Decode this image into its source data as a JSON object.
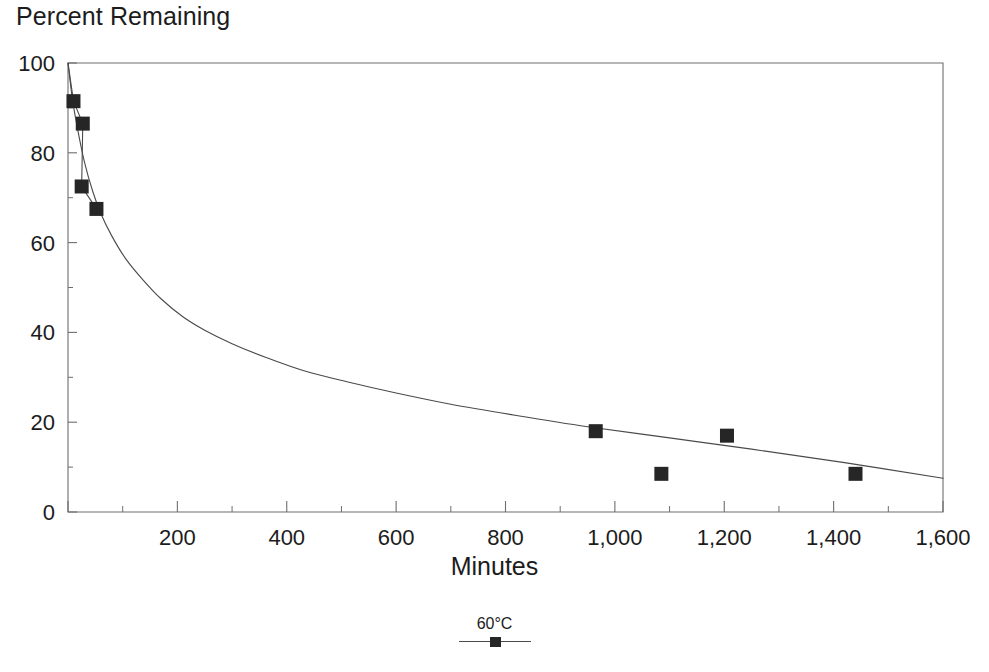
{
  "chart_data": {
    "type": "scatter",
    "title": "Percent Remaining",
    "xlabel": "Minutes",
    "ylabel": "Percent Remaining",
    "xlim": [
      0,
      1600
    ],
    "ylim": [
      0,
      100
    ],
    "grid": false,
    "legend_position": "bottom-center",
    "x_ticks": [
      0,
      200,
      400,
      600,
      800,
      1000,
      1200,
      1400,
      1600
    ],
    "x_tick_labels": [
      "",
      "200",
      "400",
      "600",
      "800",
      "1,000",
      "1,200",
      "1,400",
      "1,600"
    ],
    "x_minor_ticks": [
      100,
      300,
      500,
      700,
      900,
      1100,
      1300,
      1500
    ],
    "y_ticks": [
      0,
      20,
      40,
      60,
      80,
      100
    ],
    "y_tick_labels": [
      "0",
      "20",
      "40",
      "60",
      "80",
      "100"
    ],
    "y_minor_ticks": [
      10,
      30,
      50,
      70,
      90
    ],
    "series": [
      {
        "name": "60°C",
        "marker": "square",
        "marker_color": "#262626",
        "line_color": "#4a4a4a",
        "points": [
          {
            "x": 10,
            "y": 91.5
          },
          {
            "x": 27,
            "y": 86.5
          },
          {
            "x": 25,
            "y": 72.5
          },
          {
            "x": 52,
            "y": 67.5
          },
          {
            "x": 965,
            "y": 18.0
          },
          {
            "x": 1085,
            "y": 8.5
          },
          {
            "x": 1205,
            "y": 17.0
          },
          {
            "x": 1440,
            "y": 8.5
          }
        ],
        "fit_curve": [
          {
            "x": 0,
            "y": 100.0
          },
          {
            "x": 8,
            "y": 92.0
          },
          {
            "x": 18,
            "y": 85.0
          },
          {
            "x": 30,
            "y": 78.0
          },
          {
            "x": 45,
            "y": 71.5
          },
          {
            "x": 60,
            "y": 66.5
          },
          {
            "x": 80,
            "y": 61.5
          },
          {
            "x": 105,
            "y": 56.5
          },
          {
            "x": 135,
            "y": 52.0
          },
          {
            "x": 170,
            "y": 47.5
          },
          {
            "x": 210,
            "y": 43.5
          },
          {
            "x": 250,
            "y": 40.5
          },
          {
            "x": 300,
            "y": 37.5
          },
          {
            "x": 360,
            "y": 34.5
          },
          {
            "x": 430,
            "y": 31.5
          },
          {
            "x": 510,
            "y": 29.0
          },
          {
            "x": 600,
            "y": 26.5
          },
          {
            "x": 700,
            "y": 24.0
          },
          {
            "x": 820,
            "y": 21.5
          },
          {
            "x": 950,
            "y": 19.0
          },
          {
            "x": 1100,
            "y": 16.5
          },
          {
            "x": 1250,
            "y": 14.0
          },
          {
            "x": 1420,
            "y": 11.0
          },
          {
            "x": 1600,
            "y": 7.5
          }
        ]
      }
    ]
  },
  "legend": {
    "label": "60°C"
  },
  "axes": {
    "title": "Percent Remaining",
    "x_title": "Minutes"
  },
  "colors": {
    "marker": "#262626",
    "line": "#4a4a4a",
    "axis": "#6e6e6e",
    "text": "#1c1c1c"
  }
}
